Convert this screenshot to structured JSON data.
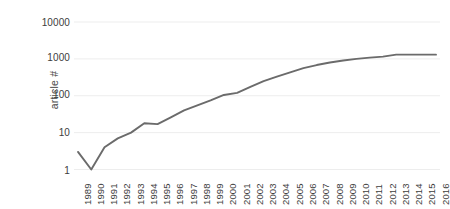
{
  "chart_data": {
    "type": "line",
    "title": "",
    "xlabel": "",
    "ylabel": "article #",
    "yscale": "log",
    "ylim": [
      1,
      10000
    ],
    "ytick_labels": [
      "10000",
      "1000",
      "100",
      "10",
      "1"
    ],
    "ytick_values": [
      10000,
      1000,
      100,
      10,
      1
    ],
    "grid": true,
    "grid_axis": "y",
    "legend": "none",
    "line_color": "#6b6b6b",
    "categories": [
      "1989",
      "1990",
      "1991",
      "1992",
      "1993",
      "1994",
      "1995",
      "1996",
      "1997",
      "1998",
      "1999",
      "2000",
      "2001",
      "2002",
      "2003",
      "2004",
      "2005",
      "2006",
      "2007",
      "2008",
      "2009",
      "2010",
      "2011",
      "2012",
      "2013",
      "2014",
      "2015",
      "2016"
    ],
    "x": [
      1989,
      1990,
      1991,
      1992,
      1993,
      1994,
      1995,
      1996,
      1997,
      1998,
      1999,
      2000,
      2001,
      2002,
      2003,
      2004,
      2005,
      2006,
      2007,
      2008,
      2009,
      2010,
      2011,
      2012,
      2013,
      2014,
      2015,
      2016
    ],
    "values": [
      3,
      1,
      4,
      7,
      10,
      18,
      17,
      26,
      40,
      55,
      75,
      105,
      120,
      175,
      250,
      330,
      430,
      560,
      680,
      800,
      900,
      1000,
      1080,
      1150,
      1300,
      1300,
      1300,
      1300
    ],
    "series": [
      {
        "name": "article #",
        "values": [
          3,
          1,
          4,
          7,
          10,
          18,
          17,
          26,
          40,
          55,
          75,
          105,
          120,
          175,
          250,
          330,
          430,
          560,
          680,
          800,
          900,
          1000,
          1080,
          1150,
          1300,
          1300,
          1300,
          1300
        ]
      }
    ]
  },
  "axes": {
    "y_title": "article #"
  }
}
